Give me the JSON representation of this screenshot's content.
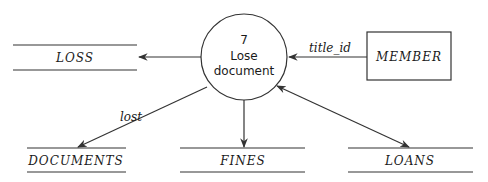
{
  "diagram": {
    "type": "data-flow-diagram",
    "process": {
      "number": "7",
      "name_line1": "Lose",
      "name_line2": "document"
    },
    "external_entity": {
      "label": "MEMBER"
    },
    "data_stores": {
      "loss": "LOSS",
      "documents": "DOCUMENTS",
      "fines": "FINES",
      "loans": "LOANS"
    },
    "flows": {
      "member_to_process": "title_id",
      "process_to_documents": "lost"
    },
    "edges": [
      {
        "from": "MEMBER",
        "to": "7 Lose document",
        "label": "title_id"
      },
      {
        "from": "7 Lose document",
        "to": "LOSS",
        "label": ""
      },
      {
        "from": "7 Lose document",
        "to": "DOCUMENTS",
        "label": "lost"
      },
      {
        "from": "7 Lose document",
        "to": "FINES",
        "label": ""
      },
      {
        "from": "7 Lose document",
        "to": "LOANS",
        "label": "",
        "bidirectional": true
      }
    ]
  }
}
